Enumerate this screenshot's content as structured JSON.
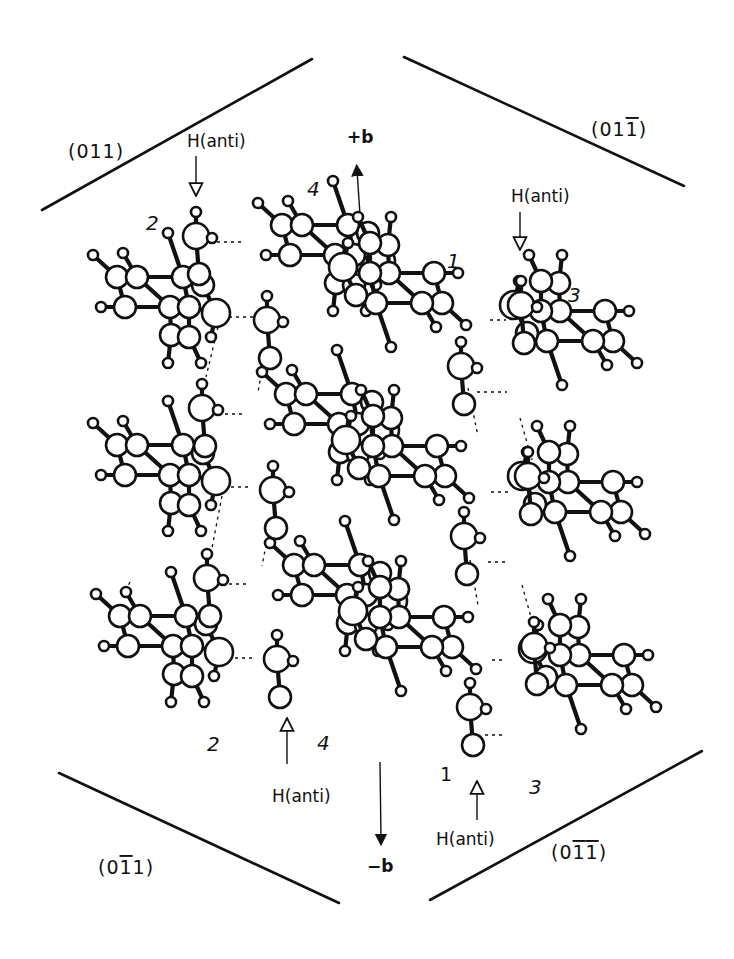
{
  "figure": {
    "width": 734,
    "height": 959,
    "ink_color": "#111111",
    "background": "#ffffff"
  },
  "planes": [
    {
      "id": "p011",
      "label": "(011)",
      "overbar_index": null,
      "line": [
        42,
        210,
        312,
        59
      ],
      "label_pos": [
        68,
        158
      ]
    },
    {
      "id": "p01-1",
      "label": "(011)",
      "overbar_index": 3,
      "line": [
        404,
        57,
        684,
        186
      ],
      "label_pos": [
        591,
        136
      ]
    },
    {
      "id": "p0-11",
      "label": "(011)",
      "overbar_index": 2,
      "line": [
        59,
        773,
        339,
        903
      ],
      "label_pos": [
        98,
        874
      ]
    },
    {
      "id": "p0-1-1",
      "label": "(011)",
      "overbar_index": [
        2,
        3
      ],
      "line": [
        430,
        900,
        702,
        751
      ],
      "label_pos": [
        551,
        859
      ]
    }
  ],
  "axes": [
    {
      "id": "plus-b",
      "label": "+b",
      "line": [
        362,
        245,
        357,
        170
      ],
      "head_at": "end",
      "label_pos": [
        347,
        143
      ]
    },
    {
      "id": "minus-b",
      "label": "−b",
      "line": [
        380,
        762,
        381,
        840
      ],
      "head_at": "end",
      "label_pos": [
        367,
        872
      ]
    }
  ],
  "h_anti_labels": [
    {
      "id": "hanti-top-left",
      "label": "H(anti)",
      "text_pos": [
        187,
        147
      ],
      "arrow": [
        196,
        156,
        196,
        196
      ],
      "direction": "down"
    },
    {
      "id": "hanti-top-right",
      "label": "H(anti)",
      "text_pos": [
        511,
        202
      ],
      "arrow": [
        520,
        212,
        520,
        250
      ],
      "direction": "down"
    },
    {
      "id": "hanti-bottom-left",
      "label": "H(anti)",
      "text_pos": [
        272,
        802
      ],
      "arrow": [
        287,
        764,
        287,
        718
      ],
      "direction": "up"
    },
    {
      "id": "hanti-bottom-right",
      "label": "H(anti)",
      "text_pos": [
        436,
        845
      ],
      "arrow": [
        477,
        820,
        477,
        781
      ],
      "direction": "up"
    }
  ],
  "molecule_labels": [
    {
      "id": "num-2-top",
      "text": "2",
      "pos": [
        146,
        230
      ],
      "style": "italic"
    },
    {
      "id": "num-4-top",
      "text": "4",
      "pos": [
        307,
        196
      ],
      "style": "italic"
    },
    {
      "id": "num-1-top",
      "text": "1",
      "pos": [
        447,
        268
      ],
      "style": "italic"
    },
    {
      "id": "num-3-top",
      "text": "3",
      "pos": [
        568,
        302
      ],
      "style": "italic"
    },
    {
      "id": "num-4-bottom",
      "text": "4",
      "pos": [
        317,
        750
      ],
      "style": "italic"
    },
    {
      "id": "num-2-bottom",
      "text": "2",
      "pos": [
        207,
        751
      ],
      "style": "italic"
    },
    {
      "id": "num-1-bottom",
      "text": "1",
      "pos": [
        440,
        781
      ],
      "style": "upright"
    },
    {
      "id": "num-3-bottom",
      "text": "3",
      "pos": [
        529,
        794
      ],
      "style": "italic"
    }
  ],
  "molecule_template": {
    "atoms": [
      {
        "x": 0,
        "y": 0,
        "r": 5,
        "t": "H"
      },
      {
        "x": 30,
        "y": -2,
        "r": 5,
        "t": "H"
      },
      {
        "x": 75,
        "y": -22,
        "r": 5,
        "t": "H"
      },
      {
        "x": 24,
        "y": 22,
        "r": 11,
        "t": "C"
      },
      {
        "x": 44,
        "y": 22,
        "r": 11,
        "t": "C"
      },
      {
        "x": 90,
        "y": 22,
        "r": 11,
        "t": "C"
      },
      {
        "x": 110,
        "y": 30,
        "r": 11,
        "t": "C"
      },
      {
        "x": 8,
        "y": 52,
        "r": 5,
        "t": "H"
      },
      {
        "x": 32,
        "y": 52,
        "r": 11,
        "t": "C"
      },
      {
        "x": 77,
        "y": 52,
        "r": 11,
        "t": "C"
      },
      {
        "x": 96,
        "y": 52,
        "r": 11,
        "t": "C"
      },
      {
        "x": 123,
        "y": 58,
        "r": 14,
        "t": "O"
      },
      {
        "x": 78,
        "y": 80,
        "r": 11,
        "t": "C"
      },
      {
        "x": 96,
        "y": 82,
        "r": 11,
        "t": "C"
      },
      {
        "x": 118,
        "y": 82,
        "r": 5,
        "t": "H"
      },
      {
        "x": 75,
        "y": 108,
        "r": 5,
        "t": "H"
      },
      {
        "x": 108,
        "y": 108,
        "r": 5,
        "t": "H"
      }
    ],
    "bonds": [
      [
        0,
        3
      ],
      [
        1,
        4
      ],
      [
        2,
        5
      ],
      [
        3,
        4
      ],
      [
        4,
        5
      ],
      [
        5,
        6
      ],
      [
        3,
        8
      ],
      [
        7,
        8
      ],
      [
        4,
        9
      ],
      [
        8,
        9
      ],
      [
        9,
        10
      ],
      [
        5,
        10
      ],
      [
        6,
        11
      ],
      [
        10,
        11
      ],
      [
        9,
        12
      ],
      [
        10,
        13
      ],
      [
        12,
        13
      ],
      [
        11,
        14
      ],
      [
        12,
        15
      ],
      [
        13,
        16
      ]
    ]
  },
  "ch_group_template": {
    "atoms": [
      {
        "x": 0,
        "y": 0,
        "r": 5,
        "t": "H"
      },
      {
        "x": 0,
        "y": 24,
        "r": 13,
        "t": "C"
      },
      {
        "x": 16,
        "y": 26,
        "r": 5,
        "t": "H"
      },
      {
        "x": 3,
        "y": 62,
        "r": 11,
        "t": "C"
      }
    ],
    "bonds": [
      [
        0,
        1
      ],
      [
        1,
        2
      ],
      [
        1,
        3
      ]
    ]
  },
  "molecules": [
    {
      "id": "mol-2-r1",
      "origin": [
        93,
        255
      ],
      "flip": false
    },
    {
      "id": "mol-2-r2",
      "origin": [
        93,
        423
      ],
      "flip": false
    },
    {
      "id": "mol-2-r3",
      "origin": [
        96,
        594
      ],
      "flip": false
    },
    {
      "id": "mol-4-r1",
      "origin": [
        258,
        203
      ],
      "flip": false
    },
    {
      "id": "mol-4-r2",
      "origin": [
        262,
        372
      ],
      "flip": false
    },
    {
      "id": "mol-4-r3",
      "origin": [
        270,
        543
      ],
      "flip": false
    },
    {
      "id": "mol-1-r1",
      "origin": [
        466,
        277
      ],
      "flip": true
    },
    {
      "id": "mol-1-r2",
      "origin": [
        469,
        450
      ],
      "flip": true
    },
    {
      "id": "mol-1-r3",
      "origin": [
        476,
        621
      ],
      "flip": true
    },
    {
      "id": "mol-3-r1",
      "origin": [
        637,
        315
      ],
      "flip": true
    },
    {
      "id": "mol-3-r2",
      "origin": [
        645,
        486
      ],
      "flip": true
    },
    {
      "id": "mol-3-r3",
      "origin": [
        656,
        659
      ],
      "flip": true
    }
  ],
  "ch_groups": [
    {
      "id": "ch-2-r1",
      "origin": [
        196,
        212
      ]
    },
    {
      "id": "ch-2-r2",
      "origin": [
        202,
        384
      ]
    },
    {
      "id": "ch-2-r3",
      "origin": [
        207,
        554
      ]
    },
    {
      "id": "ch-4-r1",
      "origin": [
        267,
        296
      ]
    },
    {
      "id": "ch-4-r2",
      "origin": [
        273,
        466
      ]
    },
    {
      "id": "ch-4-r3",
      "origin": [
        277,
        635
      ]
    },
    {
      "id": "ch-1-r1",
      "origin": [
        461,
        342
      ]
    },
    {
      "id": "ch-1-r2",
      "origin": [
        464,
        512
      ]
    },
    {
      "id": "ch-1-r3",
      "origin": [
        470,
        683
      ]
    },
    {
      "id": "ch-3-r1",
      "origin": [
        521,
        281
      ]
    },
    {
      "id": "ch-3-r2",
      "origin": [
        528,
        452
      ]
    },
    {
      "id": "ch-3-r3",
      "origin": [
        534,
        622
      ]
    }
  ],
  "hbonds": [
    [
      217,
      242,
      245,
      242
    ],
    [
      222,
      317,
      253,
      317
    ],
    [
      218,
      414,
      246,
      414
    ],
    [
      224,
      487,
      252,
      487
    ],
    [
      222,
      584,
      250,
      584
    ],
    [
      228,
      658,
      256,
      658
    ],
    [
      490,
      320,
      506,
      320
    ],
    [
      477,
      392,
      507,
      392
    ],
    [
      491,
      492,
      508,
      492
    ],
    [
      488,
      562,
      506,
      562
    ],
    [
      492,
      660,
      506,
      660
    ],
    [
      485,
      735,
      503,
      735
    ],
    [
      218,
      327,
      206,
      377
    ],
    [
      265,
      353,
      258,
      392
    ],
    [
      222,
      496,
      212,
      548
    ],
    [
      270,
      524,
      262,
      566
    ],
    [
      468,
      388,
      478,
      436
    ],
    [
      520,
      418,
      532,
      460
    ],
    [
      470,
      560,
      478,
      605
    ],
    [
      522,
      585,
      534,
      628
    ],
    [
      130,
      582,
      126,
      590
    ]
  ]
}
